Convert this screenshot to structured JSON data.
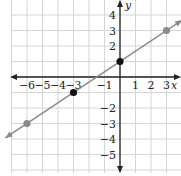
{
  "chart_data": {
    "type": "line",
    "title": "",
    "xlabel": "x",
    "ylabel": "y",
    "xlim": [
      -7,
      4
    ],
    "ylim": [
      -6,
      5
    ],
    "grid": true,
    "x_ticks": [
      "-6",
      "-5",
      "-4",
      "-3",
      "-1",
      "1",
      "2",
      "3"
    ],
    "y_ticks": [
      "4",
      "3",
      "2",
      "-2",
      "-3",
      "-4",
      "-5"
    ],
    "line": {
      "equation": "y = (2/3)x + 1",
      "slope": 0.6667,
      "intercept": 1,
      "color": "#8a8a8a"
    },
    "points": [
      {
        "x": 3,
        "y": 3,
        "color": "#8a8a8a"
      },
      {
        "x": 0,
        "y": 1,
        "color": "#111111"
      },
      {
        "x": -3,
        "y": -1,
        "color": "#111111"
      },
      {
        "x": -6,
        "y": -3,
        "color": "#8a8a8a"
      }
    ]
  }
}
